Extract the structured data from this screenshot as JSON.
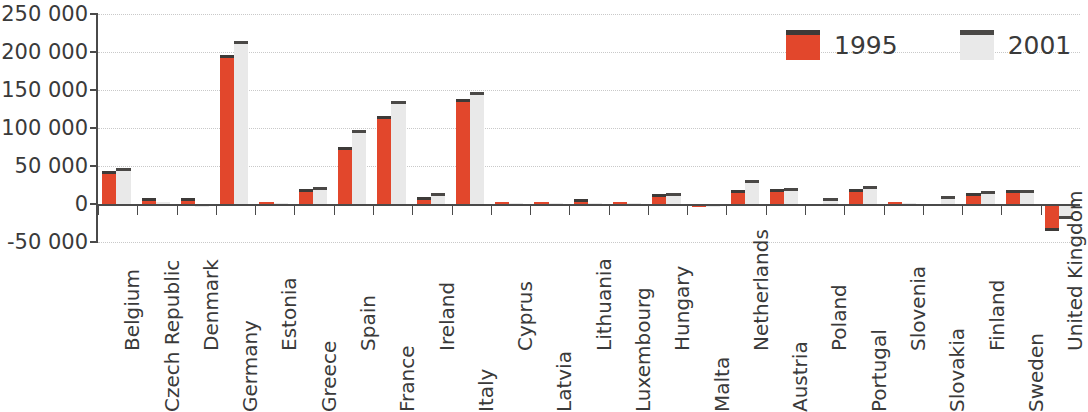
{
  "chart_data": {
    "type": "bar",
    "title": "",
    "subtitle": "",
    "xlabel": "",
    "ylabel": "",
    "ylim": [
      -50000,
      250000
    ],
    "ytick_step": 50000,
    "ytick_labels": [
      "250 000",
      "200 000",
      "150 000",
      "100 000",
      "50 000",
      "0",
      "-50 000"
    ],
    "ytick_values": [
      250000,
      200000,
      150000,
      100000,
      50000,
      0,
      -50000
    ],
    "grid": true,
    "grid_style": "dotted horizontal",
    "legend_position": "top-right",
    "categories": [
      "Belgium",
      "Czech Republic",
      "Denmark",
      "Germany",
      "Estonia",
      "Greece",
      "Spain",
      "France",
      "Ireland",
      "Italy",
      "Cyprus",
      "Latvia",
      "Lithuania",
      "Luxembourg",
      "Hungary",
      "Malta",
      "Netherlands",
      "Austria",
      "Poland",
      "Portugal",
      "Slovenia",
      "Slovakia",
      "Finland",
      "Sweden",
      "United Kingdom"
    ],
    "series": [
      {
        "name": "1995",
        "color": "#e2472c",
        "values": [
          43000,
          8000,
          8000,
          196000,
          2000,
          20000,
          75000,
          116000,
          9000,
          138000,
          2000,
          3000,
          6000,
          3000,
          13000,
          500,
          18000,
          20000,
          0,
          20000,
          3000,
          0,
          15000,
          19000,
          -35000
        ]
      },
      {
        "name": "2001",
        "color": "#e9e9e9",
        "values": [
          48000,
          3000,
          -3000,
          215000,
          1500,
          22000,
          97000,
          135000,
          14000,
          148000,
          1000,
          1500,
          1500,
          1000,
          15000,
          500,
          32000,
          21000,
          8000,
          24000,
          1000,
          11000,
          17000,
          19000,
          -20000
        ]
      }
    ]
  },
  "legend": {
    "items": [
      {
        "label": "1995",
        "color": "#e2472c"
      },
      {
        "label": "2001",
        "color": "#e9e9e9"
      }
    ]
  },
  "axis": {
    "y_labels": [
      "250 000",
      "200 000",
      "150 000",
      "100 000",
      "50 000",
      "0",
      "-50 000"
    ]
  }
}
